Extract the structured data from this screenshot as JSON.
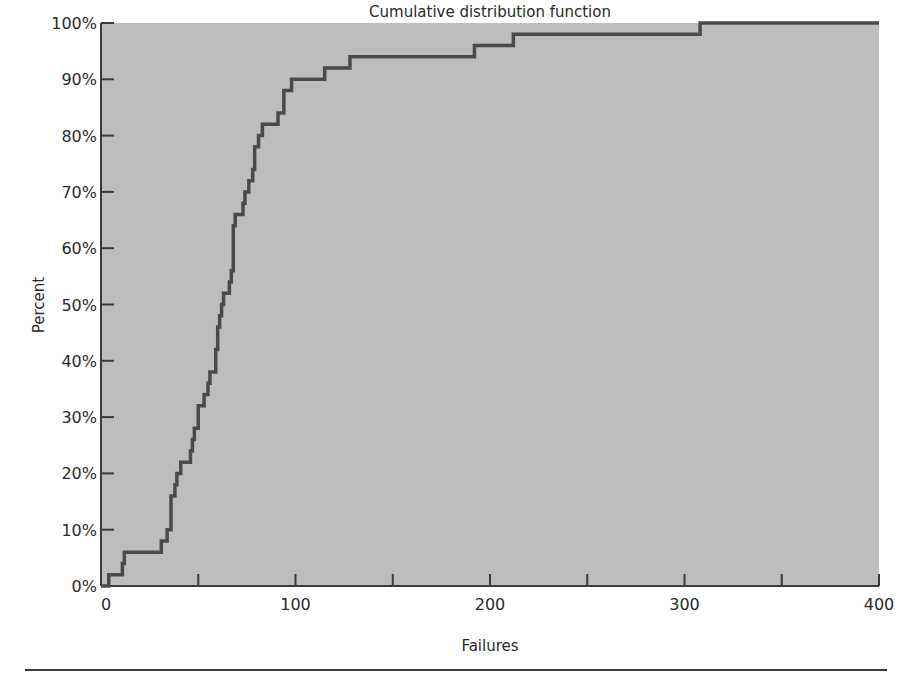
{
  "chart_data": {
    "type": "line",
    "subtype": "step",
    "title": "Cumulative distribution function",
    "xlabel": "Failures",
    "ylabel": "Percent",
    "xlim": [
      0,
      400
    ],
    "ylim": [
      0,
      100
    ],
    "x_ticks": [
      0,
      50,
      100,
      150,
      200,
      250,
      300,
      350,
      400
    ],
    "x_tick_labels": [
      "0",
      "100",
      "200",
      "300",
      "400"
    ],
    "x_tick_label_values": [
      0,
      100,
      200,
      300,
      400
    ],
    "y_ticks": [
      0,
      10,
      20,
      30,
      40,
      50,
      60,
      70,
      80,
      90,
      100
    ],
    "y_tick_labels": [
      "0%",
      "10%",
      "20%",
      "30%",
      "40%",
      "50%",
      "60%",
      "70%",
      "80%",
      "90%",
      "100%"
    ],
    "grid": false,
    "legend": null,
    "background_color": "#bdbdbd",
    "line_color": "#4a4a4a",
    "series": [
      {
        "name": "Cumulative distribution function",
        "x": [
          0,
          4,
          11,
          12,
          31,
          34,
          36,
          38,
          39,
          41,
          46,
          47,
          48,
          50,
          53,
          55,
          56,
          59,
          60,
          61,
          62,
          63,
          66,
          67,
          68,
          69,
          73,
          74,
          76,
          78,
          79,
          81,
          83,
          91,
          94,
          98,
          115,
          128,
          192,
          212,
          308,
          400
        ],
        "y": [
          0,
          2,
          4,
          6,
          8,
          10,
          16,
          18,
          20,
          22,
          24,
          26,
          28,
          32,
          34,
          36,
          38,
          42,
          46,
          48,
          50,
          52,
          54,
          56,
          64,
          66,
          68,
          70,
          72,
          74,
          78,
          80,
          82,
          84,
          88,
          90,
          92,
          94,
          96,
          98,
          100,
          100
        ]
      }
    ]
  }
}
